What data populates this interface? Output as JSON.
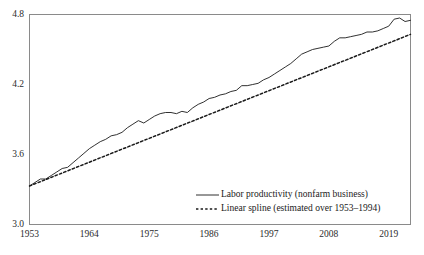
{
  "chart_data": {
    "type": "line",
    "title": "",
    "subtitle": "",
    "xlabel": "",
    "ylabel": "",
    "xlim": [
      1953,
      2023
    ],
    "ylim": [
      3.0,
      4.8
    ],
    "grid": false,
    "legend_position": "inside-bottom-right",
    "x_ticks": [
      "1953",
      "1964",
      "1975",
      "1986",
      "1997",
      "2008",
      "2019"
    ],
    "x_tick_values": [
      1953,
      1964,
      1975,
      1986,
      1997,
      2008,
      2019
    ],
    "y_ticks": [
      "3.0",
      "3.6",
      "4.2",
      "4.8"
    ],
    "y_tick_values": [
      3.0,
      3.6,
      4.2,
      4.8
    ],
    "series": [
      {
        "name": "Labor productivity (nonfarm business)",
        "style": "solid",
        "color": "#1a1a1a",
        "x": [
          1953,
          1954,
          1955,
          1956,
          1957,
          1958,
          1959,
          1960,
          1961,
          1962,
          1963,
          1964,
          1965,
          1966,
          1967,
          1968,
          1969,
          1970,
          1971,
          1972,
          1973,
          1974,
          1975,
          1976,
          1977,
          1978,
          1979,
          1980,
          1981,
          1982,
          1983,
          1984,
          1985,
          1986,
          1987,
          1988,
          1989,
          1990,
          1991,
          1992,
          1993,
          1994,
          1995,
          1996,
          1997,
          1998,
          1999,
          2000,
          2001,
          2002,
          2003,
          2004,
          2005,
          2006,
          2007,
          2008,
          2009,
          2010,
          2011,
          2012,
          2013,
          2014,
          2015,
          2016,
          2017,
          2018,
          2019,
          2020,
          2021,
          2022,
          2023
        ],
        "y": [
          3.33,
          3.36,
          3.39,
          3.39,
          3.42,
          3.45,
          3.48,
          3.49,
          3.53,
          3.57,
          3.61,
          3.65,
          3.68,
          3.71,
          3.73,
          3.76,
          3.77,
          3.79,
          3.83,
          3.86,
          3.89,
          3.87,
          3.9,
          3.93,
          3.95,
          3.96,
          3.96,
          3.95,
          3.97,
          3.96,
          4.0,
          4.03,
          4.05,
          4.08,
          4.09,
          4.11,
          4.12,
          4.14,
          4.15,
          4.19,
          4.19,
          4.2,
          4.21,
          4.24,
          4.26,
          4.29,
          4.32,
          4.35,
          4.38,
          4.42,
          4.46,
          4.48,
          4.5,
          4.51,
          4.52,
          4.53,
          4.57,
          4.6,
          4.6,
          4.61,
          4.62,
          4.63,
          4.65,
          4.65,
          4.66,
          4.68,
          4.7,
          4.76,
          4.77,
          4.74,
          4.75
        ]
      },
      {
        "name": "Linear spline (estimated over 1953–1994)",
        "style": "dashed",
        "color": "#1a1a1a",
        "x": [
          1953,
          2023
        ],
        "y": [
          3.33,
          4.63
        ],
        "note": "estimated over 1953-1994, extrapolated thereafter"
      }
    ],
    "legend": [
      {
        "label": "Labor productivity (nonfarm business)",
        "style": "solid"
      },
      {
        "label": "Linear spline (estimated over 1953–1994)",
        "style": "dashed"
      }
    ]
  }
}
